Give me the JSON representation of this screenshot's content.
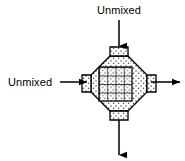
{
  "figure": {
    "background_color": "#ffffff",
    "line_color": "#000000",
    "stipple_color": "#555555",
    "grid_color": "#222222",
    "labels": {
      "top_inlet": "Unmixed",
      "left_inlet": "Unmixed"
    },
    "arrows": [
      {
        "name": "top-inlet-arrow",
        "direction": "down",
        "label": "Unmixed",
        "from": [
          119,
          20
        ],
        "to": [
          119,
          46
        ]
      },
      {
        "name": "left-inlet-arrow",
        "direction": "right",
        "label": "Unmixed",
        "from": [
          60,
          82
        ],
        "to": [
          88,
          82
        ]
      },
      {
        "name": "right-outlet-arrow",
        "direction": "right",
        "label": "",
        "from": [
          152,
          82
        ],
        "to": [
          180,
          82
        ]
      },
      {
        "name": "bottom-outlet-arrow",
        "direction": "down",
        "label": "",
        "from": [
          119,
          120
        ],
        "to": [
          119,
          155
        ]
      }
    ],
    "body": {
      "name": "mixing-element",
      "shape": "octagonal-diamond",
      "fill_pattern": "stipple",
      "center": [
        119,
        84
      ],
      "tabs": [
        {
          "name": "top-tab",
          "position": "top",
          "fill_pattern": "stipple"
        },
        {
          "name": "left-tab",
          "position": "left",
          "fill_pattern": "stipple"
        },
        {
          "name": "right-tab",
          "position": "right",
          "fill_pattern": "stipple"
        },
        {
          "name": "bottom-tab",
          "position": "bottom",
          "fill_pattern": "stipple"
        }
      ],
      "core": {
        "name": "mixed-core",
        "shape": "square",
        "fill_pattern": "grid",
        "grid_rows": 4,
        "grid_columns": 4,
        "bounds": [
          99,
          67,
          33,
          34
        ]
      }
    }
  }
}
